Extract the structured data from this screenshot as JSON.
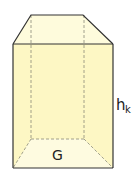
{
  "diagram": {
    "type": "prism",
    "labels": {
      "base": "G",
      "height": "h",
      "height_subscript": "k"
    },
    "colors": {
      "fill": "#fdf7c4",
      "fill_top": "#fefbdc",
      "fill_bottom": "#fefbe0",
      "edge": "#333333",
      "hidden_edge": "#8a8a7a"
    }
  }
}
